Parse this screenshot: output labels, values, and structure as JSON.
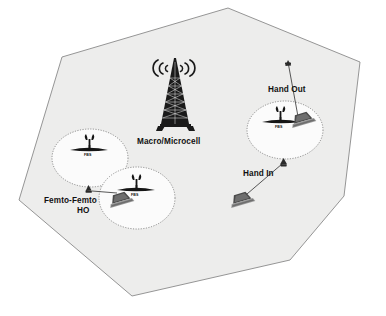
{
  "diagram": {
    "macro_cell": {
      "label": "Macro/Microcell",
      "shape": "hexagon",
      "fill_color": "#ededec",
      "border_color": "#8a8a8a",
      "tower_icon": "cell-tower-icon"
    },
    "femto_cells": [
      {
        "id": "femto-left",
        "bs_label": "FBS",
        "bs_icon": "femto-base-station-icon",
        "cx": 90,
        "cy": 158,
        "rx": 38,
        "ry": 29
      },
      {
        "id": "femto-lower",
        "bs_label": "FBS",
        "bs_icon": "femto-base-station-icon",
        "cx": 137,
        "cy": 198,
        "rx": 38,
        "ry": 31
      },
      {
        "id": "femto-right",
        "bs_label": "FBS",
        "bs_icon": "femto-base-station-icon",
        "cx": 285,
        "cy": 130,
        "rx": 38,
        "ry": 29
      }
    ],
    "handover_labels": [
      {
        "id": "hand-out",
        "text": "Hand Out",
        "x": 298,
        "y": 89
      },
      {
        "id": "hand-in",
        "text": "Hand In",
        "x": 265,
        "y": 173
      },
      {
        "id": "femto-femto",
        "line1": "Femto-Femto",
        "line2": "HO",
        "x": 88,
        "y": 201
      }
    ],
    "user_devices": [
      {
        "id": "ue-femto-femto",
        "icon": "laptop-icon",
        "x": 118,
        "y": 205
      },
      {
        "id": "ue-hand-out",
        "icon": "laptop-icon",
        "x": 300,
        "y": 125
      },
      {
        "id": "ue-hand-in",
        "icon": "laptop-icon",
        "x": 240,
        "y": 205
      }
    ],
    "colors": {
      "macro_fill": "#ededec",
      "macro_border": "#8a8a8a",
      "cell_border": "#6f6f6f",
      "link": "#3a3a3a",
      "text": "#111111",
      "background": "#ffffff"
    }
  }
}
